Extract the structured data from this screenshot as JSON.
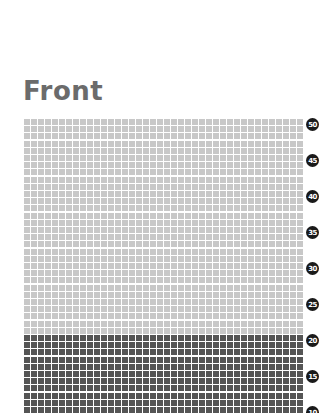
{
  "title": "Front",
  "grid": {
    "columns": 40,
    "rows_visible_top": 50,
    "rows_visible_bottom": 10,
    "column_block_size": 5,
    "row_block_size": 5,
    "dark_threshold_row": 20,
    "colors": {
      "light_cell": "#c8c8c8",
      "dark_cell": "#555555"
    }
  },
  "row_labels": [
    "50",
    "45",
    "40",
    "35",
    "30",
    "25",
    "20",
    "15",
    "10"
  ]
}
